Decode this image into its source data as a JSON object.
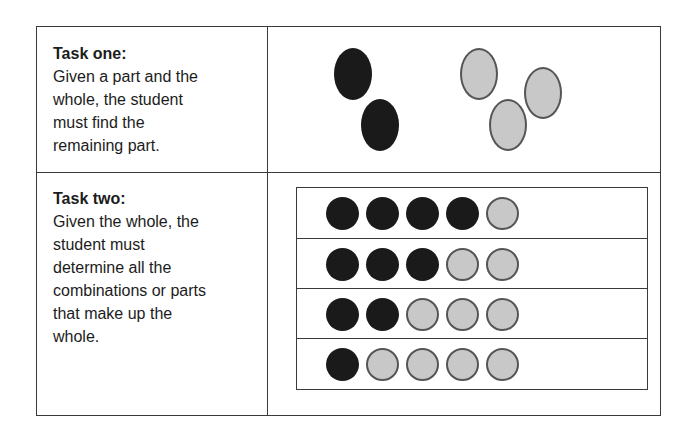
{
  "task_one": {
    "title": "Task one:",
    "lines": [
      "Given a part and the",
      "whole, the student",
      "must find the",
      "remaining part."
    ],
    "diagram": {
      "black_counters": 2,
      "gray_counters": 3
    }
  },
  "task_two": {
    "title": "Task two:",
    "lines": [
      "Given the whole, the",
      "student must",
      "determine all the",
      "combinations or parts",
      "that make up the",
      "whole."
    ],
    "diagram": {
      "rows": [
        {
          "black": 4,
          "gray": 1
        },
        {
          "black": 3,
          "gray": 2
        },
        {
          "black": 2,
          "gray": 3
        },
        {
          "black": 1,
          "gray": 4
        }
      ]
    }
  },
  "colors": {
    "black_counter": "#1a1a1a",
    "gray_counter": "#c8c8c8",
    "counter_border": "#555555",
    "highlighter": "#969696",
    "table_border": "#3a3a3a"
  }
}
